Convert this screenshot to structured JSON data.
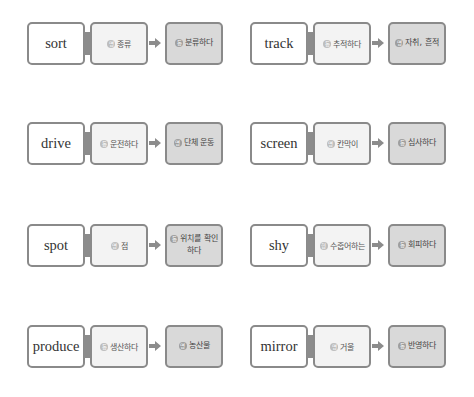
{
  "colors": {
    "border": "#8a8a8a",
    "word_bg": "#ffffff",
    "meaning_bg": "#f3f3f3",
    "derived_bg": "#d9d9d9",
    "arrow": "#8c8c8c"
  },
  "cards": [
    {
      "word": "sort",
      "meaning_pos": "명",
      "meaning": "종류",
      "derived_pos": "동",
      "derived": "분류하다"
    },
    {
      "word": "track",
      "meaning_pos": "동",
      "meaning": "추적하다",
      "derived_pos": "명",
      "derived": "자취, 흔적"
    },
    {
      "word": "drive",
      "meaning_pos": "동",
      "meaning": "운전하다",
      "derived_pos": "명",
      "derived": "단체 운동"
    },
    {
      "word": "screen",
      "meaning_pos": "명",
      "meaning": "칸막이",
      "derived_pos": "동",
      "derived": "심사하다"
    },
    {
      "word": "spot",
      "meaning_pos": "명",
      "meaning": "점",
      "derived_pos": "동",
      "derived": "위치를 확인하다"
    },
    {
      "word": "shy",
      "meaning_pos": "형",
      "meaning": "수줍어하는",
      "derived_pos": "동",
      "derived": "회피하다"
    },
    {
      "word": "produce",
      "meaning_pos": "동",
      "meaning": "생산하다",
      "derived_pos": "명",
      "derived": "농산물"
    },
    {
      "word": "mirror",
      "meaning_pos": "명",
      "meaning": "거울",
      "derived_pos": "동",
      "derived": "반영하다"
    }
  ]
}
